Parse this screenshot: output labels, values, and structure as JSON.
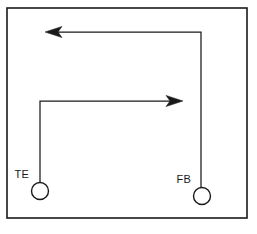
{
  "figure": {
    "background_color": "#ffffff",
    "line_color": "#1a1a1a",
    "frame": {
      "x": 7,
      "y": 8,
      "width": 240,
      "height": 210,
      "stroke_width": 1.6
    }
  },
  "nodes": [
    {
      "id": "te",
      "label": "TE",
      "shape": "circle",
      "cx": 40,
      "cy": 191,
      "r": 8.5,
      "label_x": 29,
      "label_y": 178,
      "label_anchor": "end"
    },
    {
      "id": "fb",
      "label": "FB",
      "shape": "circle",
      "cx": 202,
      "cy": 196,
      "r": 8.5,
      "label_x": 191,
      "label_y": 183,
      "label_anchor": "end"
    }
  ],
  "connectors": [
    {
      "id": "forward-path",
      "from": "te",
      "to": "right",
      "direction": "right",
      "arrow": "right-arrowhead",
      "path": "M 40 182 L 40 101 L 180 101",
      "tip_x": 183,
      "tip_y": 101
    },
    {
      "id": "feedback-path",
      "from": "fb",
      "to": "left",
      "direction": "left",
      "arrow": "left-arrowhead",
      "path": "M 201 187 L 201 32 L 48 32",
      "tip_x": 45,
      "tip_y": 32
    }
  ],
  "arrowheads": {
    "right": {
      "id": "right-arrowhead",
      "length": 15,
      "half_width": 5.5,
      "notch": 4
    },
    "left": {
      "id": "left-arrowhead",
      "length": 15,
      "half_width": 5.5,
      "notch": 4
    }
  }
}
